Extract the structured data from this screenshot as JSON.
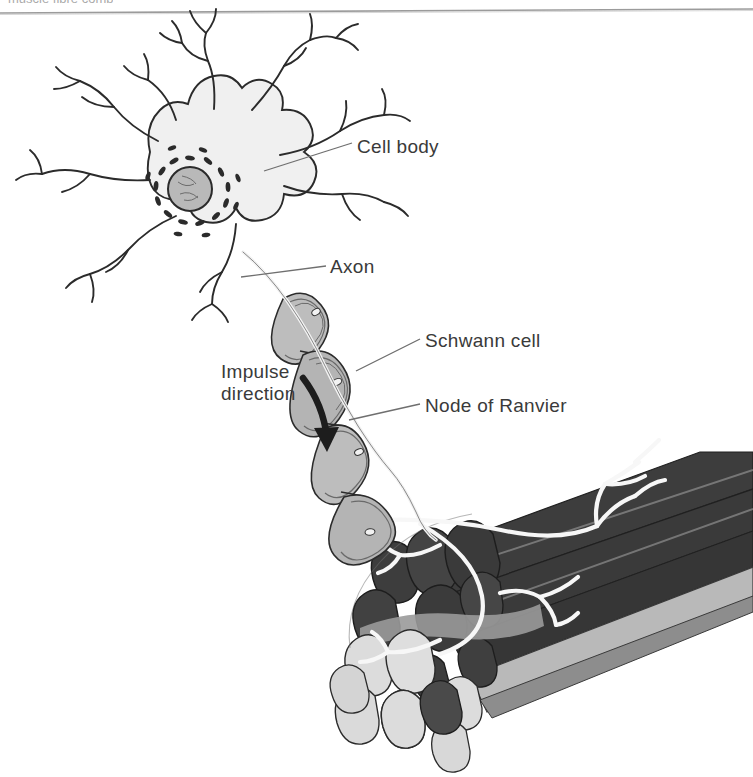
{
  "page": {
    "width": 753,
    "height": 777,
    "background_color": "#ffffff",
    "cropped_header_text": "muscle fibre comp",
    "rule_color": "#8a8a8a"
  },
  "figure": {
    "style": "grayscale line drawing",
    "labels": [
      {
        "id": "cell-body",
        "text": "Cell body"
      },
      {
        "id": "axon",
        "text": "Axon"
      },
      {
        "id": "schwann-cell",
        "text": "Schwann cell"
      },
      {
        "id": "node-of-ranvier",
        "text": "Node of Ranvier"
      }
    ],
    "annotation": {
      "line1": "Impulse",
      "line2": "direction",
      "arrow": "curved-down-arrow"
    },
    "parts": {
      "dendrites": "branching dendrites",
      "nucleus": "nucleus",
      "nissl_bodies": "nissl bodies",
      "myelin_sheath": "myelin sheath segments",
      "axon_terminals": "axon terminal branches",
      "muscle_bundle": "skeletal muscle fibre bundle"
    }
  },
  "colors": {
    "ink": "#2b2b2b",
    "label_text": "#3a3a3a",
    "leader_line": "#6f6f6f",
    "soma_fill": "#f0f0f0",
    "nucleus_fill": "#b9b9b9",
    "schwann_fill": "#b4b4b4",
    "schwann_fill_light": "#d2d2d2",
    "muscle_dark": "#3d3d3d",
    "muscle_mid": "#6e6e6e",
    "muscle_light": "#dcdcdc",
    "muscle_light_mid": "#a9a9a9",
    "nerve_white": "#f7f7f7"
  }
}
